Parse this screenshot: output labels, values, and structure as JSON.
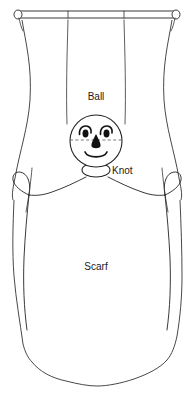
{
  "diagram": {
    "background_color": "#ffffff",
    "line_color": "#222222",
    "width": 195,
    "height": 400,
    "labels": {
      "ball": "Ball",
      "knot": "Knot",
      "scarf": "Scarf"
    },
    "parts": [
      {
        "id": "rod",
        "name": "hanging rod",
        "description": "horizontal dowel with rounded end caps across the top"
      },
      {
        "id": "string-left",
        "name": "left hanging string",
        "description": "vertical string from rod down to the ball"
      },
      {
        "id": "string-right",
        "name": "right hanging string",
        "description": "vertical string from rod down to the ball"
      },
      {
        "id": "ball",
        "name": "ball head",
        "description": "circular ball forming the head with a drawn face"
      },
      {
        "id": "knot",
        "name": "neck knot",
        "description": "small ellipse tied under the ball"
      },
      {
        "id": "scarf",
        "name": "scarf body",
        "description": "draped fabric body with wavy hem"
      },
      {
        "id": "loop-left",
        "name": "left tied loop",
        "description": "small loop knot at the left arm tie"
      },
      {
        "id": "loop-right",
        "name": "right tied loop",
        "description": "small loop knot at the right arm tie"
      },
      {
        "id": "face",
        "name": "drawn face",
        "description": "two eyes, teardrop nose and smiling mouth"
      }
    ],
    "face": {
      "eyes": 2,
      "nose": "teardrop",
      "mouth": "smile",
      "guide_line": "dashed horizontal centerline at eye level"
    }
  }
}
